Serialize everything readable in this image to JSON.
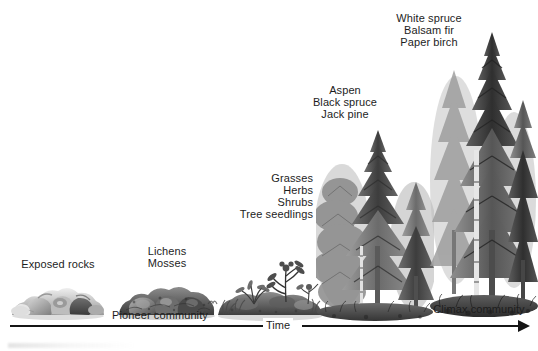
{
  "figure": {
    "type": "ecological-succession-diagram",
    "background_color": "#ffffff",
    "ink_color": "#1d1d1d",
    "style": "grayscale halftone illustration"
  },
  "axis": {
    "label": "Time",
    "direction": "left-to-right",
    "arrowhead": "right",
    "start_marker": "Pioneer community",
    "end_marker": "Climax community"
  },
  "community_labels": {
    "pioneer": "Pioneer community",
    "climax": "Climax community"
  },
  "stages": [
    {
      "id": "stage-1",
      "order": 1,
      "label_lines": [
        "Exposed rocks"
      ],
      "label": "Exposed rocks",
      "illustration": "bare-rock-pile",
      "relative_height": 0.12
    },
    {
      "id": "stage-2",
      "order": 2,
      "label_lines": [
        "Lichens",
        "Mosses"
      ],
      "label": "Lichens Mosses",
      "illustration": "lichen-moss-covered-rocks",
      "relative_height": 0.13
    },
    {
      "id": "stage-3",
      "order": 3,
      "label_lines": [
        "Grasses",
        "Herbs",
        "Shrubs",
        "Tree seedlings"
      ],
      "label": "Grasses Herbs Shrubs Tree seedlings",
      "illustration": "grasses-shrubs-seedlings",
      "relative_height": 0.28
    },
    {
      "id": "stage-4",
      "order": 4,
      "label_lines": [
        "Aspen",
        "Black spruce",
        "Jack pine"
      ],
      "label": "Aspen Black spruce Jack pine",
      "illustration": "young-mixed-forest",
      "relative_height": 0.62
    },
    {
      "id": "stage-5",
      "order": 5,
      "label_lines": [
        "White spruce",
        "Balsam fir",
        "Paper birch"
      ],
      "label": "White spruce Balsam fir Paper birch",
      "illustration": "mature-conifer-forest",
      "relative_height": 0.92
    }
  ]
}
